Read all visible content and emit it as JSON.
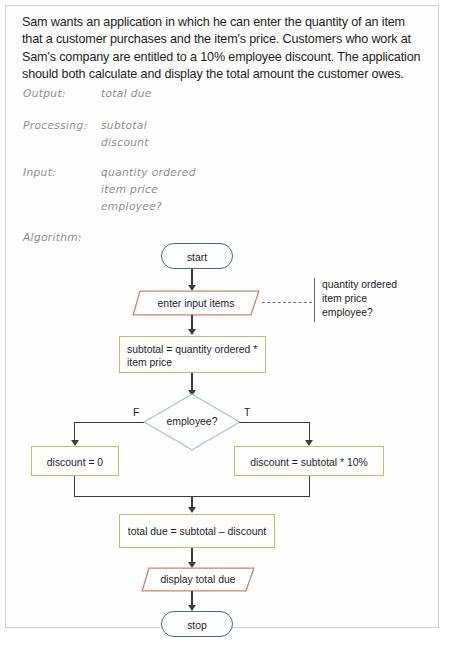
{
  "page": {
    "problem_statement": "Sam wants an application in which he can enter the quantity of an item that a customer purchases and the item's price. Customers who work at Sam's company are entitled to a 10% employee discount. The application should both calculate and display the total amount the customer owes."
  },
  "ipo": {
    "output_label": "Output:",
    "output_values": [
      "total due"
    ],
    "processing_label": "Processing:",
    "processing_values": [
      "subtotal",
      "discount"
    ],
    "input_label": "Input:",
    "input_values": [
      "quantity ordered",
      "item price",
      "employee?"
    ],
    "algorithm_label": "Algorithm:"
  },
  "flowchart": {
    "start": "start",
    "enter_input": "enter input items",
    "subtotal_line1": "subtotal = quantity ordered *",
    "subtotal_line2": "item price",
    "decision": "employee?",
    "branch_false": "F",
    "branch_true": "T",
    "discount_false": "discount = 0",
    "discount_true": "discount = subtotal * 10%",
    "total_due": "total due = subtotal – discount",
    "display": "display total due",
    "stop": "stop",
    "annotation": [
      "quantity ordered",
      "item price",
      "employee?"
    ]
  },
  "colors": {
    "terminal_border": "#516775",
    "parallelogram_border": "#c8846a",
    "process_border": "#cdb86a",
    "decision_border": "#adc2c4",
    "connector": "#3c3c3c",
    "annotation": "#6b6b6b",
    "handwriting": "#8d8d8d",
    "body_text": "#1d1d1d",
    "page_border": "#cfcfcf"
  }
}
